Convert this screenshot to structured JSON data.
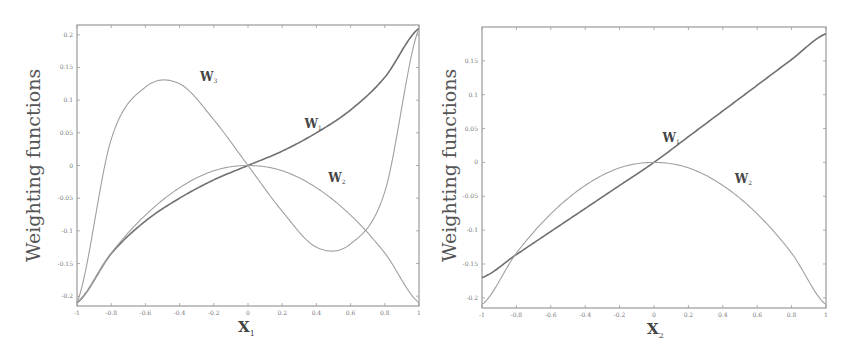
{
  "chart_data": [
    {
      "type": "line",
      "title": "",
      "xlabel": "X",
      "xlabel_sub": "1",
      "ylabel": "Weighting functions",
      "xlim": [
        -1,
        1
      ],
      "ylim": [
        -0.215,
        0.215
      ],
      "grid": false,
      "xticks": [
        -1,
        -0.8,
        -0.6,
        -0.4,
        -0.2,
        0,
        0.2,
        0.4,
        0.6,
        0.8,
        1
      ],
      "xtick_labels": [
        "-1",
        "-0.8",
        "-0.6",
        "-0.4",
        "-0.2",
        "0",
        "0.2",
        "0.4",
        "0.6",
        "0.8",
        "1"
      ],
      "yticks": [
        0.2,
        0.15,
        0.1,
        0.05,
        0,
        -0.05,
        -0.1,
        -0.15,
        -0.2
      ],
      "ytick_labels": [
        "0.2",
        "0.15",
        "0.1",
        "0.05",
        "0",
        "-0.05",
        "-0.1",
        "-0.15",
        "-0.2"
      ],
      "x": [
        -1,
        -0.8,
        -0.6,
        -0.4,
        -0.2,
        0,
        0.2,
        0.4,
        0.6,
        0.8,
        1
      ],
      "series": [
        {
          "name": "W1",
          "label": "W",
          "sub": "1",
          "values": [
            -0.21,
            -0.135,
            -0.085,
            -0.05,
            -0.022,
            0,
            0.022,
            0.05,
            0.085,
            0.135,
            0.21
          ]
        },
        {
          "name": "W2",
          "label": "W",
          "sub": "2",
          "values": [
            -0.21,
            -0.134,
            -0.076,
            -0.034,
            -0.008,
            0,
            -0.008,
            -0.034,
            -0.076,
            -0.134,
            -0.21
          ]
        },
        {
          "name": "W3",
          "label": "W",
          "sub": "3",
          "values": [
            -0.21,
            0.04,
            0.12,
            0.125,
            0.07,
            0,
            -0.07,
            -0.125,
            -0.12,
            -0.04,
            0.21
          ]
        }
      ],
      "annotations": [
        {
          "text": "W3",
          "x": -0.28,
          "y": 0.13
        },
        {
          "text": "W1",
          "x": 0.33,
          "y": 0.058
        },
        {
          "text": "W2",
          "x": 0.47,
          "y": -0.025
        }
      ]
    },
    {
      "type": "line",
      "title": "",
      "xlabel": "X",
      "xlabel_sub": "2",
      "ylabel": "Weighting functions",
      "xlim": [
        -1,
        1
      ],
      "ylim": [
        -0.215,
        0.2
      ],
      "grid": false,
      "xticks": [
        -1,
        -0.8,
        -0.6,
        -0.4,
        -0.2,
        0,
        0.2,
        0.4,
        0.6,
        0.8,
        1
      ],
      "xtick_labels": [
        "-1",
        "-0.8",
        "-0.6",
        "-0.4",
        "-0.2",
        "0",
        "0.2",
        "0.4",
        "0.6",
        "0.8",
        "1"
      ],
      "yticks": [
        0.15,
        0.1,
        0.05,
        0,
        -0.05,
        -0.1,
        -0.15,
        -0.2
      ],
      "ytick_labels": [
        "0.15",
        "0.1",
        "0.05",
        "0",
        "-0.05",
        "-0.1",
        "-0.15",
        "-0.2"
      ],
      "x": [
        -1,
        -0.8,
        -0.6,
        -0.4,
        -0.2,
        0,
        0.2,
        0.4,
        0.6,
        0.8,
        1
      ],
      "series": [
        {
          "name": "W1",
          "label": "W",
          "sub": "1",
          "values": [
            -0.17,
            -0.136,
            -0.102,
            -0.068,
            -0.034,
            0,
            0.038,
            0.076,
            0.114,
            0.152,
            0.19
          ]
        },
        {
          "name": "W2",
          "label": "W",
          "sub": "2",
          "values": [
            -0.21,
            -0.134,
            -0.076,
            -0.034,
            -0.008,
            0,
            -0.008,
            -0.034,
            -0.076,
            -0.134,
            -0.21
          ]
        }
      ],
      "annotations": [
        {
          "text": "W1",
          "x": 0.05,
          "y": 0.03
        },
        {
          "text": "W2",
          "x": 0.47,
          "y": -0.03
        }
      ]
    }
  ],
  "panels": [
    {
      "ylabel": "Weighting functions",
      "xlabel": "X",
      "xlabel_sub": "1"
    },
    {
      "ylabel": "Weighting functions",
      "xlabel": "X",
      "xlabel_sub": "2"
    }
  ],
  "colors": {
    "frame": "#9a9a9a",
    "curve_dark": "#707070",
    "curve_light": "#a0a0a0",
    "text": "#555555"
  }
}
